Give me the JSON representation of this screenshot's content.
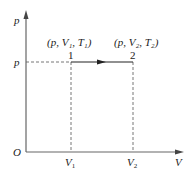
{
  "diagram": {
    "type": "p-V diagram (isobaric process)",
    "axes": {
      "y_label": "p",
      "x_label": "V",
      "origin_label": "O"
    },
    "y_tick": "p",
    "x_ticks": [
      {
        "base": "V",
        "sub": "1"
      },
      {
        "base": "V",
        "sub": "2"
      }
    ],
    "states": [
      {
        "id": "1",
        "label": "(p, V₁, T₁)"
      },
      {
        "id": "2",
        "label": "(p, V₂, T₂)"
      }
    ],
    "process": {
      "from": "1",
      "to": "2",
      "direction": "right"
    },
    "colors": {
      "line": "#222222",
      "axis": "#555555",
      "dashed": "#555555"
    }
  }
}
